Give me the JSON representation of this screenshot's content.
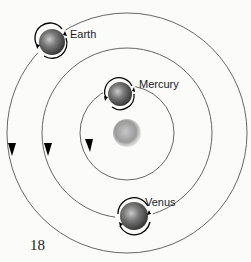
{
  "diagram": {
    "center": {
      "name": "Sun",
      "x": 127,
      "y": 133,
      "r": 13
    },
    "orbits": [
      {
        "name": "Earth",
        "r": 120,
        "arrow_x": 12,
        "arrow_y": 150
      },
      {
        "name": "Venus",
        "r": 88,
        "arrow_x": 47,
        "arrow_y": 150
      },
      {
        "name": "Mercury",
        "r": 50,
        "arrow_x": 90,
        "arrow_y": 148
      }
    ],
    "planets": [
      {
        "label": "Earth",
        "x": 52,
        "y": 42,
        "r": 14
      },
      {
        "label": "Mercury",
        "x": 120,
        "y": 95,
        "r": 13
      },
      {
        "label": "Venus",
        "x": 134,
        "y": 216,
        "r": 15
      }
    ]
  },
  "page_number": "18",
  "colors": {
    "orbit": "#555555",
    "planet": "#6a6a6a",
    "sun": "#9a9a9a",
    "background": "#fbfbfa"
  }
}
